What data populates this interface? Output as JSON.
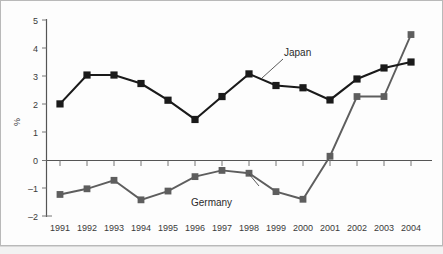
{
  "chart_data": {
    "type": "line",
    "title": "",
    "xlabel": "",
    "ylabel": "%",
    "categories": [
      "1991",
      "1992",
      "1993",
      "1994",
      "1995",
      "1996",
      "1997",
      "1998",
      "1999",
      "2000",
      "2001",
      "2002",
      "2003",
      "2004"
    ],
    "ylim": [
      -2,
      5
    ],
    "yticks": [
      -2,
      -1,
      0,
      1,
      2,
      3,
      4,
      5
    ],
    "ytick_labels": [
      "–2",
      "–1",
      "0",
      "1",
      "2",
      "3",
      "4",
      "5"
    ],
    "grid": false,
    "legend_position": "inline-annotations",
    "series": [
      {
        "name": "Japan",
        "color": "#1a1a1a",
        "marker": "square",
        "values": [
          2.0,
          3.02,
          3.02,
          2.72,
          2.13,
          1.45,
          2.26,
          3.06,
          2.65,
          2.57,
          2.14,
          2.88,
          3.27,
          3.48
        ]
      },
      {
        "name": "Germany",
        "color": "#5e5e5e",
        "marker": "square",
        "values": [
          -1.2,
          -1.0,
          -0.7,
          -1.39,
          -1.08,
          -0.57,
          -0.35,
          -0.45,
          -1.1,
          -1.37,
          0.15,
          2.26,
          2.26,
          4.45
        ]
      }
    ],
    "annotations": [
      {
        "text": "Japan",
        "target_series": "Japan",
        "target_category": "1998"
      },
      {
        "text": "Germany",
        "target_series": "Germany",
        "target_category": "1999"
      }
    ]
  },
  "axis": {
    "y_title": "%",
    "y_tick_5": "5",
    "y_tick_4": "4",
    "y_tick_3": "3",
    "y_tick_2": "2",
    "y_tick_1": "1",
    "y_tick_0": "0",
    "y_tick_m1": "–1",
    "y_tick_m2": "–2"
  },
  "x_labels": {
    "y1991": "1991",
    "y1992": "1992",
    "y1993": "1993",
    "y1994": "1994",
    "y1995": "1995",
    "y1996": "1996",
    "y1997": "1997",
    "y1998": "1998",
    "y1999": "1999",
    "y2000": "2000",
    "y2001": "2001",
    "y2002": "2002",
    "y2003": "2003",
    "y2004": "2004"
  },
  "labels": {
    "japan": "Japan",
    "germany": "Germany"
  },
  "colors": {
    "japan": "#1a1a1a",
    "germany": "#5e5e5e",
    "axis": "#555555",
    "text": "#3a3a3a",
    "background": "#ffffff",
    "frame": "#b9b9b9"
  }
}
